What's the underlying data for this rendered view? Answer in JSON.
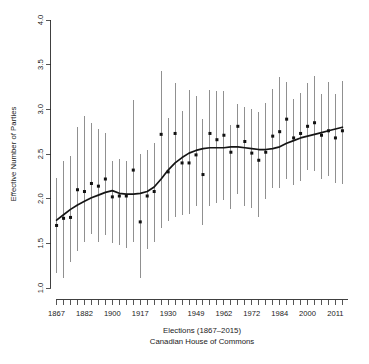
{
  "chart_data": {
    "type": "scatter",
    "title": "",
    "xlabel": "Elections (1867–2015)",
    "xlabel_line2": "Canadian House of Commons",
    "ylabel": "Effective Number of Parties",
    "xlim": [
      0.2,
      42.8
    ],
    "ylim": [
      1.0,
      4.0
    ],
    "grid": false,
    "legend": null,
    "y_ticks": [
      "1.0",
      "1.5",
      "2.0",
      "2.5",
      "3.0",
      "3.5",
      "4.0"
    ],
    "y_tick_values": [
      1.0,
      1.5,
      2.0,
      2.5,
      3.0,
      3.5,
      4.0
    ],
    "x_tick_labels": [
      "1867",
      "1882",
      "1900",
      "1917",
      "1930",
      "1949",
      "1962",
      "1972",
      "1984",
      "2000",
      "2011"
    ],
    "x_tick_label_indices": [
      1,
      5,
      9,
      13,
      17,
      21,
      25,
      29,
      33,
      37,
      41
    ],
    "n_points": 42,
    "x_values": [
      1,
      2,
      3,
      4,
      5,
      6,
      7,
      8,
      9,
      10,
      11,
      12,
      13,
      14,
      15,
      16,
      17,
      18,
      19,
      20,
      21,
      22,
      23,
      24,
      25,
      26,
      27,
      28,
      29,
      30,
      31,
      32,
      33,
      34,
      35,
      36,
      37,
      38,
      39,
      40,
      41,
      42
    ],
    "election_years": [
      1867,
      1872,
      1874,
      1878,
      1882,
      1887,
      1891,
      1896,
      1900,
      1904,
      1908,
      1911,
      1917,
      1921,
      1925,
      1926,
      1930,
      1935,
      1940,
      1945,
      1949,
      1953,
      1957,
      1958,
      1962,
      1963,
      1965,
      1968,
      1972,
      1974,
      1979,
      1980,
      1984,
      1988,
      1993,
      1997,
      2000,
      2004,
      2006,
      2008,
      2011,
      2015
    ],
    "series": [
      {
        "name": "Effective Number of Parties",
        "values": [
          1.7,
          1.78,
          1.79,
          2.1,
          2.08,
          2.17,
          2.14,
          2.22,
          2.02,
          2.03,
          2.03,
          2.32,
          1.74,
          2.03,
          2.08,
          2.72,
          2.3,
          2.73,
          2.4,
          2.4,
          2.49,
          2.27,
          2.73,
          2.66,
          2.71,
          2.52,
          2.81,
          2.64,
          2.51,
          2.43,
          2.52,
          2.7,
          2.75,
          2.89,
          2.68,
          2.73,
          2.81,
          2.85,
          2.71,
          2.76,
          2.68,
          2.76
        ],
        "ci_lower": [
          1.17,
          1.11,
          1.29,
          1.41,
          1.52,
          1.6,
          1.52,
          1.59,
          1.5,
          1.48,
          1.45,
          1.52,
          1.11,
          1.44,
          1.52,
          1.67,
          1.75,
          1.8,
          1.82,
          1.83,
          1.92,
          1.71,
          1.92,
          1.95,
          1.98,
          1.88,
          2.05,
          1.92,
          1.9,
          1.8,
          2.0,
          2.12,
          2.12,
          2.22,
          2.15,
          2.2,
          2.32,
          2.31,
          2.22,
          2.25,
          2.18,
          2.16
        ],
        "ci_upper": [
          2.23,
          2.42,
          2.48,
          2.8,
          2.92,
          2.85,
          2.78,
          2.73,
          2.42,
          2.44,
          2.42,
          3.1,
          2.5,
          2.54,
          2.62,
          3.43,
          2.9,
          3.29,
          2.98,
          3.22,
          3.15,
          2.89,
          3.22,
          3.2,
          3.21,
          2.82,
          3.06,
          3.03,
          3.0,
          2.97,
          3.07,
          3.23,
          3.36,
          3.31,
          3.12,
          3.18,
          3.3,
          3.37,
          3.17,
          3.31,
          3.17,
          3.32
        ]
      }
    ],
    "smooth_curve": {
      "name": "loess-trend",
      "x": [
        1,
        2,
        3,
        4,
        5,
        6,
        7,
        8,
        9,
        10,
        11,
        12,
        13,
        14,
        15,
        16,
        17,
        18,
        19,
        20,
        21,
        22,
        23,
        24,
        25,
        26,
        27,
        28,
        29,
        30,
        31,
        32,
        33,
        34,
        35,
        36,
        37,
        38,
        39,
        40,
        41,
        42
      ],
      "y": [
        1.76,
        1.82,
        1.88,
        1.93,
        1.97,
        2.01,
        2.04,
        2.07,
        2.09,
        2.06,
        2.05,
        2.05,
        2.06,
        2.08,
        2.13,
        2.22,
        2.32,
        2.4,
        2.46,
        2.51,
        2.54,
        2.56,
        2.57,
        2.57,
        2.57,
        2.58,
        2.58,
        2.57,
        2.56,
        2.55,
        2.55,
        2.56,
        2.58,
        2.62,
        2.65,
        2.68,
        2.7,
        2.72,
        2.74,
        2.76,
        2.78,
        2.8
      ]
    }
  },
  "colors": {
    "axis": "#2b2b2b",
    "point": "#111111",
    "interval": "#7d7d7d",
    "trend": "#151515",
    "background": "#ffffff"
  }
}
